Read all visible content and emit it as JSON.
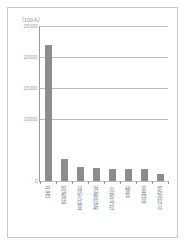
{
  "figure": {
    "unit_caption": "（100人）",
    "background_color": "#ffffff",
    "border_color": "#c8c8c8"
  },
  "chart_data": {
    "type": "bar",
    "title": "",
    "subtitle": "",
    "xlabel": "",
    "ylabel": "（100人）",
    "categories": [
      "巴西",
      "阿根廷",
      "哥伦比亚",
      "洪都拉斯",
      "瓜地马拉",
      "秘鲁",
      "墨西哥",
      "尼加拉瓜"
    ],
    "values": [
      22000,
      3500,
      2300,
      2100,
      2000,
      1950,
      1900,
      1100
    ],
    "ylim": [
      0,
      25000
    ],
    "ytick_labels": [
      "0",
      "10000",
      "15000",
      "20000",
      "25000"
    ],
    "ytick_values": [
      0,
      10000,
      15000,
      20000,
      25000
    ],
    "gridlines": [
      0,
      10000,
      15000,
      20000,
      25000
    ],
    "grid": true,
    "legend": "none",
    "bar_color": "#8c8c8c",
    "gridline_color": "#bdbdbd",
    "axis_color": "#9a9a9a",
    "tick_text_color": "#9b9b9b"
  }
}
